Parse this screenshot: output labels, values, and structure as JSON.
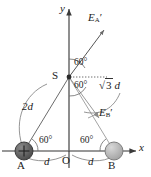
{
  "figure": {
    "type": "physics-vector-diagram",
    "axes": {
      "x_label": "x",
      "y_label": "y",
      "origin_label": "O"
    },
    "points": {
      "A": {
        "label": "A",
        "charge_sign": "+",
        "fill": "#595959"
      },
      "B": {
        "label": "B",
        "charge_sign": "",
        "fill": "#b0b0b0"
      },
      "S": {
        "label": "S"
      },
      "O": {
        "label": "O"
      }
    },
    "vectors": [
      {
        "name": "E_A_prime",
        "base": "E",
        "sub": "A",
        "prime": "′",
        "direction": "up-right",
        "angle_deg": 60
      },
      {
        "name": "E_B_prime",
        "base": "E",
        "sub": "B",
        "prime": "′",
        "direction": "down-right",
        "angle_deg": -60
      }
    ],
    "angle_labels": [
      {
        "id": "angle-S-upper",
        "text": "60°"
      },
      {
        "id": "angle-S-lower",
        "text": "60°"
      },
      {
        "id": "angle-A",
        "text": "60°"
      },
      {
        "id": "angle-B",
        "text": "60°"
      }
    ],
    "distance_labels": [
      {
        "id": "dist-2d",
        "text": "2d",
        "italic": true
      },
      {
        "id": "dist-sqrt3d",
        "radical": "√",
        "radicand": "3",
        "unit": "d"
      },
      {
        "id": "dist-d-left",
        "text": "d",
        "italic": true
      },
      {
        "id": "dist-d-right",
        "text": "d",
        "italic": true
      }
    ],
    "colors": {
      "line": "#4d4d4d",
      "axis": "#333333",
      "charge_a": "#595959",
      "charge_b": "#b0b0b0",
      "dotted": "#777777"
    }
  }
}
